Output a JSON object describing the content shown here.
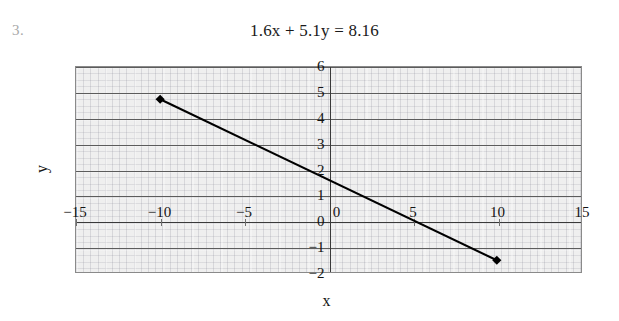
{
  "item": {
    "number": "3."
  },
  "equation": {
    "text": "1.6x + 5.1y = 8.16"
  },
  "chart_data": {
    "type": "line",
    "title": "1.6x + 5.1y = 8.16",
    "xlabel": "x",
    "ylabel": "y",
    "xlim": [
      -15,
      15
    ],
    "ylim": [
      -2,
      6
    ],
    "grid": true,
    "grid_orientation": "horizontal",
    "legend": "none",
    "x": [
      -10,
      10
    ],
    "y": [
      4.75,
      -1.5
    ],
    "series": [
      {
        "name": "1.6x + 5.1y = 8.16",
        "points": [
          {
            "x": -10,
            "y": 4.75
          },
          {
            "x": 10,
            "y": -1.5
          }
        ],
        "marker": "diamond",
        "color": "#000000"
      }
    ],
    "xticks": [
      -15,
      -10,
      -5,
      0,
      5,
      10,
      15
    ],
    "xtick_labels": [
      "−15",
      "−10",
      "−5",
      "0",
      "5",
      "10",
      "15"
    ],
    "yticks": [
      6,
      5,
      4,
      3,
      2,
      1,
      0,
      -1,
      -2
    ],
    "ytick_labels": [
      "6",
      "5",
      "4",
      "3",
      "2",
      "1",
      "0",
      "−1",
      "−2"
    ],
    "plot_bgcolor": "#efefef",
    "gridcolor": "#5c5c5c",
    "axiscolor": "#3a3a3a"
  }
}
